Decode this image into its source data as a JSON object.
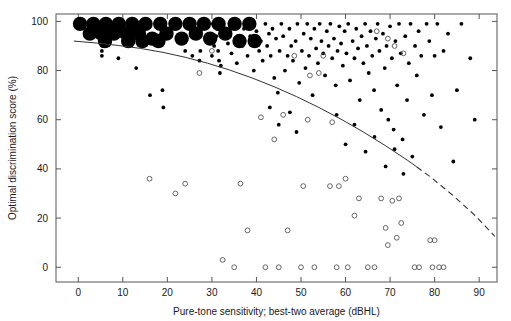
{
  "chart_data": {
    "type": "scatter",
    "title": "",
    "xlabel": "Pure-tone sensitivity; best-two average (dBHL)",
    "ylabel": "Optimal discrimination score (%)",
    "xlim": [
      -5,
      94
    ],
    "ylim": [
      -6,
      103
    ],
    "xticks": [
      0,
      10,
      20,
      30,
      40,
      50,
      60,
      70,
      80,
      90
    ],
    "yticks": [
      0,
      20,
      40,
      60,
      80,
      100
    ],
    "xtick_labels": [
      "0",
      "10",
      "20",
      "30",
      "40",
      "50",
      "60",
      "70",
      "80",
      "90"
    ],
    "ytick_labels": [
      "0",
      "20",
      "40",
      "60",
      "80",
      "100"
    ],
    "grid": false,
    "legend": "none",
    "frame": "box",
    "series": [
      {
        "name": "aided-large",
        "marker": "filled-circle",
        "marker_size": "large",
        "color": "#000000",
        "points": [
          [
            0.4,
            99
          ],
          [
            2.6,
            95
          ],
          [
            3.4,
            99
          ],
          [
            5.2,
            95
          ],
          [
            6.2,
            99
          ],
          [
            8.0,
            95
          ],
          [
            9.1,
            99
          ],
          [
            10.8,
            95
          ],
          [
            12.1,
            99
          ],
          [
            13.6,
            95
          ],
          [
            15.1,
            99
          ],
          [
            16.6,
            93
          ],
          [
            18.4,
            99
          ],
          [
            19.8,
            95
          ],
          [
            21.8,
            99
          ],
          [
            23.2,
            93
          ],
          [
            25.0,
            99
          ],
          [
            26.4,
            95
          ],
          [
            28.2,
            99
          ],
          [
            29.6,
            93
          ],
          [
            31.5,
            99
          ],
          [
            33.0,
            95
          ],
          [
            35.1,
            99
          ],
          [
            36.2,
            92
          ],
          [
            38.4,
            99
          ],
          [
            39.6,
            92
          ],
          [
            6.0,
            92
          ],
          [
            11.2,
            92
          ],
          [
            14.4,
            92
          ],
          [
            18.0,
            92
          ]
        ]
      },
      {
        "name": "aided-small",
        "marker": "filled-circle",
        "marker_size": "small",
        "color": "#000000",
        "points": [
          [
            5.3,
            88
          ],
          [
            5.3,
            86
          ],
          [
            5.4,
            90
          ],
          [
            9.0,
            85
          ],
          [
            13.0,
            81
          ],
          [
            16.1,
            70
          ],
          [
            18.9,
            72
          ],
          [
            19.1,
            65
          ],
          [
            24.0,
            88
          ],
          [
            25.6,
            86
          ],
          [
            27.2,
            84
          ],
          [
            27.4,
            88
          ],
          [
            30.0,
            86
          ],
          [
            30.5,
            90
          ],
          [
            31.0,
            94
          ],
          [
            31.2,
            97
          ],
          [
            31.4,
            88
          ],
          [
            31.6,
            84
          ],
          [
            31.8,
            79
          ],
          [
            32.0,
            82
          ],
          [
            33.2,
            95
          ],
          [
            33.6,
            91
          ],
          [
            34.4,
            87
          ],
          [
            34.8,
            98
          ],
          [
            35.2,
            93
          ],
          [
            35.6,
            83
          ],
          [
            36.8,
            90
          ],
          [
            37.2,
            97
          ],
          [
            38.0,
            86
          ],
          [
            38.6,
            94
          ],
          [
            39.2,
            99
          ],
          [
            39.4,
            80
          ],
          [
            40.0,
            96
          ],
          [
            40.6,
            88
          ],
          [
            41.0,
            92
          ],
          [
            41.4,
            84
          ],
          [
            42.0,
            99
          ],
          [
            42.4,
            90
          ],
          [
            42.8,
            95
          ],
          [
            43.2,
            86
          ],
          [
            43.6,
            97
          ],
          [
            44.0,
            77
          ],
          [
            44.4,
            93
          ],
          [
            44.8,
            71
          ],
          [
            45.2,
            88
          ],
          [
            45.6,
            99
          ],
          [
            46.0,
            94
          ],
          [
            46.4,
            80
          ],
          [
            47.0,
            86
          ],
          [
            47.4,
            97
          ],
          [
            47.8,
            90
          ],
          [
            48.2,
            84
          ],
          [
            48.8,
            92
          ],
          [
            49.2,
            99
          ],
          [
            49.6,
            75
          ],
          [
            50.2,
            88
          ],
          [
            50.6,
            95
          ],
          [
            51.0,
            81
          ],
          [
            51.4,
            99
          ],
          [
            51.8,
            86
          ],
          [
            52.2,
            93
          ],
          [
            52.6,
            70
          ],
          [
            53.0,
            97
          ],
          [
            53.4,
            89
          ],
          [
            53.8,
            83
          ],
          [
            54.2,
            99
          ],
          [
            54.6,
            92
          ],
          [
            55.0,
            87
          ],
          [
            55.4,
            78
          ],
          [
            55.8,
            96
          ],
          [
            56.2,
            90
          ],
          [
            56.6,
            99
          ],
          [
            57.0,
            85
          ],
          [
            57.4,
            93
          ],
          [
            57.8,
            74
          ],
          [
            58.2,
            88
          ],
          [
            58.6,
            98
          ],
          [
            59.0,
            91
          ],
          [
            59.4,
            82
          ],
          [
            59.8,
            96
          ],
          [
            60.2,
            87
          ],
          [
            60.6,
            99
          ],
          [
            61.0,
            76
          ],
          [
            61.6,
            92
          ],
          [
            62.0,
            85
          ],
          [
            62.4,
            97
          ],
          [
            62.8,
            89
          ],
          [
            63.2,
            68
          ],
          [
            63.6,
            94
          ],
          [
            64.0,
            83
          ],
          [
            64.4,
            99
          ],
          [
            64.8,
            90
          ],
          [
            65.2,
            79
          ],
          [
            65.6,
            96
          ],
          [
            66.0,
            86
          ],
          [
            66.4,
            72
          ],
          [
            66.8,
            93
          ],
          [
            67.2,
            99
          ],
          [
            67.6,
            88
          ],
          [
            68.0,
            64
          ],
          [
            68.4,
            95
          ],
          [
            68.8,
            81
          ],
          [
            69.2,
            90
          ],
          [
            69.6,
            60
          ],
          [
            70.0,
            98
          ],
          [
            70.4,
            85
          ],
          [
            70.8,
            56
          ],
          [
            71.2,
            92
          ],
          [
            71.6,
            74
          ],
          [
            72.0,
            99
          ],
          [
            72.4,
            87
          ],
          [
            72.8,
            52
          ],
          [
            73.4,
            94
          ],
          [
            73.8,
            68
          ],
          [
            74.2,
            83
          ],
          [
            74.6,
            99
          ],
          [
            75.0,
            45
          ],
          [
            75.6,
            90
          ],
          [
            76.0,
            78
          ],
          [
            76.4,
            96
          ],
          [
            77.0,
            86
          ],
          [
            77.6,
            62
          ],
          [
            78.2,
            99
          ],
          [
            78.8,
            92
          ],
          [
            79.4,
            70
          ],
          [
            80.0,
            86
          ],
          [
            80.6,
            99
          ],
          [
            81.4,
            57
          ],
          [
            82.0,
            88
          ],
          [
            83.0,
            95
          ],
          [
            84.2,
            43
          ],
          [
            85.0,
            72
          ],
          [
            86.0,
            99
          ],
          [
            88.0,
            85
          ],
          [
            89.0,
            60
          ],
          [
            34.0,
            99
          ],
          [
            36.0,
            99
          ],
          [
            30.2,
            99
          ],
          [
            43.0,
            65
          ],
          [
            45.0,
            58
          ],
          [
            47.5,
            63
          ],
          [
            49.0,
            55
          ],
          [
            58.0,
            62
          ],
          [
            60.0,
            50
          ],
          [
            62.0,
            58
          ],
          [
            64.5,
            47
          ],
          [
            66.5,
            53
          ],
          [
            69.0,
            41
          ],
          [
            71.0,
            48
          ],
          [
            73.0,
            38
          ]
        ]
      },
      {
        "name": "unaided",
        "marker": "open-circle",
        "marker_size": "small",
        "color": "#555555",
        "points": [
          [
            16.0,
            36
          ],
          [
            21.8,
            30
          ],
          [
            24.0,
            34
          ],
          [
            27.2,
            79
          ],
          [
            36.4,
            34
          ],
          [
            32.4,
            3
          ],
          [
            35.0,
            0
          ],
          [
            38.0,
            15
          ],
          [
            42.0,
            0
          ],
          [
            45.0,
            0
          ],
          [
            47.0,
            15
          ],
          [
            50.0,
            0
          ],
          [
            53.0,
            0
          ],
          [
            46.0,
            62
          ],
          [
            41.0,
            61
          ],
          [
            51.5,
            60
          ],
          [
            57.0,
            59
          ],
          [
            44.0,
            52
          ],
          [
            54.0,
            79
          ],
          [
            63.0,
            28
          ],
          [
            60.0,
            36
          ],
          [
            56.5,
            33
          ],
          [
            58.5,
            33
          ],
          [
            50.5,
            33
          ],
          [
            62.0,
            21
          ],
          [
            58.0,
            0
          ],
          [
            60.5,
            0
          ],
          [
            65.0,
            0
          ],
          [
            66.5,
            0
          ],
          [
            69.5,
            9
          ],
          [
            71.5,
            12
          ],
          [
            68.0,
            28
          ],
          [
            70.5,
            27
          ],
          [
            72.0,
            28
          ],
          [
            69.0,
            16
          ],
          [
            72.5,
            18
          ],
          [
            75.5,
            0
          ],
          [
            76.5,
            0
          ],
          [
            79.0,
            11
          ],
          [
            80.0,
            11
          ],
          [
            79.5,
            0
          ],
          [
            81.0,
            0
          ],
          [
            82.0,
            0
          ],
          [
            48.5,
            86
          ],
          [
            55.0,
            86
          ],
          [
            52.0,
            78
          ],
          [
            67.0,
            96
          ],
          [
            69.5,
            93
          ],
          [
            71.0,
            90
          ],
          [
            73.0,
            87
          ],
          [
            30.0,
            88
          ]
        ]
      }
    ],
    "fit_curve": {
      "name": "regression-curve",
      "style_solid_range": [
        -1,
        76
      ],
      "style_dashed_range": [
        76,
        94
      ],
      "color": "#333333",
      "points": [
        [
          -1.0,
          92.0
        ],
        [
          4.0,
          91.2
        ],
        [
          9.0,
          90.2
        ],
        [
          14.0,
          89.0
        ],
        [
          19.0,
          87.4
        ],
        [
          24.0,
          85.4
        ],
        [
          29.0,
          83.0
        ],
        [
          34.0,
          80.2
        ],
        [
          39.0,
          77.0
        ],
        [
          44.0,
          73.4
        ],
        [
          49.0,
          69.4
        ],
        [
          54.0,
          65.0
        ],
        [
          59.0,
          60.2
        ],
        [
          64.0,
          55.0
        ],
        [
          69.0,
          49.4
        ],
        [
          74.0,
          43.4
        ],
        [
          76.0,
          40.8
        ],
        [
          79.0,
          36.8
        ],
        [
          84.0,
          29.4
        ],
        [
          89.0,
          21.2
        ],
        [
          93.5,
          12.6
        ]
      ]
    }
  }
}
